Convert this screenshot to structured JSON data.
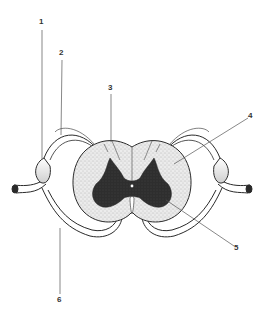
{
  "diagram": {
    "colors": {
      "ink": "#2a2a2a",
      "white_matter": "#e6e6e6",
      "gray_matter": "#2b2b2b",
      "leader_line": "#555555",
      "background": "#ffffff"
    },
    "labels": [
      {
        "id": "1",
        "text": "1"
      },
      {
        "id": "2",
        "text": "2"
      },
      {
        "id": "3",
        "text": "3"
      },
      {
        "id": "4",
        "text": "4"
      },
      {
        "id": "5",
        "text": "5"
      },
      {
        "id": "6",
        "text": "6"
      }
    ]
  }
}
